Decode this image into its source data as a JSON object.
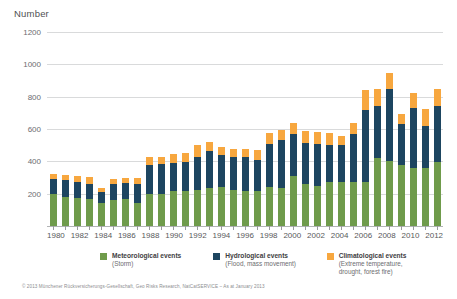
{
  "chart_data": {
    "type": "bar",
    "title": "",
    "ylabel": "Number",
    "xlabel": "",
    "ylim": [
      0,
      1200
    ],
    "yticks": [
      0,
      200,
      400,
      600,
      800,
      1000,
      1200
    ],
    "ytick_labels": [
      "",
      "200",
      "400",
      "600",
      "800",
      "1000",
      "1200"
    ],
    "grid": true,
    "stacked": true,
    "legend_position": "bottom",
    "categories": [
      1980,
      1981,
      1982,
      1983,
      1984,
      1985,
      1986,
      1987,
      1988,
      1989,
      1990,
      1991,
      1992,
      1993,
      1994,
      1995,
      1996,
      1997,
      1998,
      1999,
      2000,
      2001,
      2002,
      2003,
      2004,
      2005,
      2006,
      2007,
      2008,
      2009,
      2010,
      2011,
      2012
    ],
    "xtick_labels": [
      "1980",
      "",
      "1982",
      "",
      "1984",
      "",
      "1986",
      "",
      "1988",
      "",
      "1990",
      "",
      "1992",
      "",
      "1994",
      "",
      "1996",
      "",
      "1998",
      "",
      "2000",
      "",
      "2002",
      "",
      "2004",
      "",
      "2006",
      "",
      "2008",
      "",
      "2010",
      "",
      "2012"
    ],
    "series": [
      {
        "name": "Meteorological events",
        "sublabel": "(Storm)",
        "color": "#6f9b4b",
        "values": [
          195,
          180,
          175,
          165,
          140,
          160,
          170,
          145,
          195,
          200,
          215,
          215,
          225,
          235,
          240,
          225,
          215,
          215,
          240,
          235,
          310,
          260,
          245,
          270,
          270,
          270,
          275,
          420,
          400,
          380,
          360,
          360,
          395
        ]
      },
      {
        "name": "Hydrological events",
        "sublabel": "(Flood, mass movement)",
        "color": "#1d4560",
        "values": [
          95,
          105,
          100,
          95,
          70,
          100,
          95,
          115,
          185,
          185,
          175,
          180,
          200,
          230,
          200,
          200,
          210,
          195,
          265,
          300,
          260,
          255,
          265,
          230,
          230,
          300,
          440,
          320,
          450,
          250,
          370,
          260,
          350
        ]
      },
      {
        "name": "Climatological events",
        "sublabel": "(Extreme temperature, drought, forest fire)",
        "color": "#f7a73f",
        "values": [
          30,
          30,
          35,
          45,
          25,
          30,
          30,
          35,
          50,
          45,
          55,
          55,
          75,
          55,
          50,
          50,
          50,
          60,
          70,
          60,
          70,
          70,
          70,
          75,
          55,
          70,
          125,
          105,
          95,
          60,
          95,
          105,
          105
        ]
      }
    ]
  },
  "legend": [
    {
      "label": "Meteorological events",
      "sublabel": "(Storm)",
      "color": "#6f9b4b"
    },
    {
      "label": "Hydrological events",
      "sublabel": "(Flood, mass movement)",
      "color": "#1d4560"
    },
    {
      "label": "Climatological events",
      "sublabel": "(Extreme temperature, drought, forest fire)",
      "color": "#f7a73f"
    }
  ],
  "footer": {
    "text": "© 2013 Münchener Rückversicherungs-Gesellschaft, Geo Risks Research, NatCatSERVICE – As at January 2013"
  }
}
